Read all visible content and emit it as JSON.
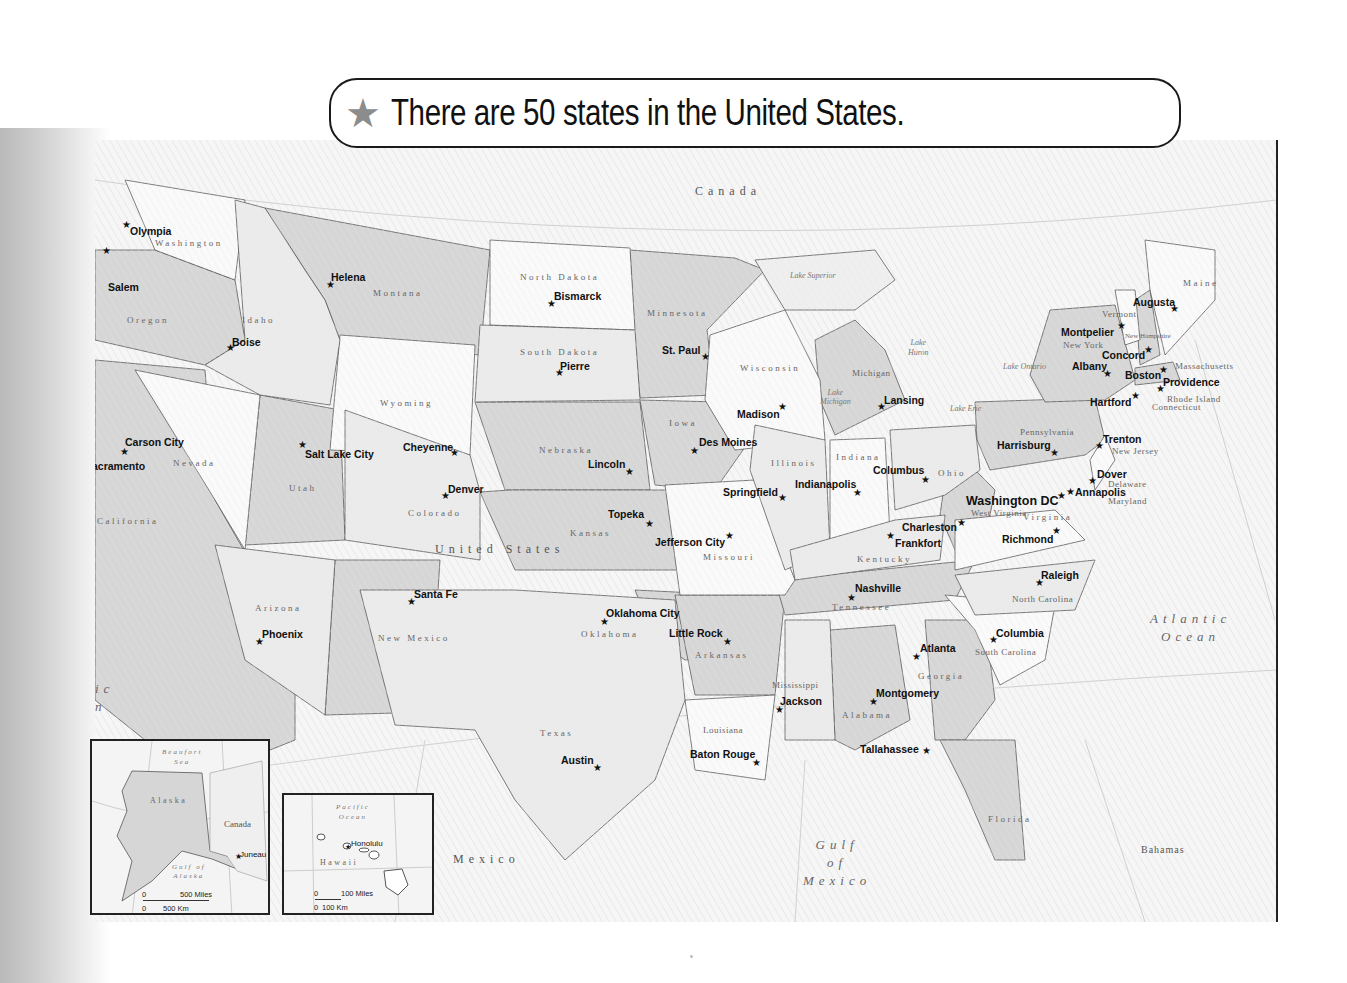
{
  "banner": {
    "icon": "★",
    "title": "There are 50 states in the United States."
  },
  "regions": {
    "canada": "Canada",
    "united_states": "United States",
    "mexico": "Mexico",
    "bahamas": "Bahamas",
    "atlantic_ocean": [
      "Atlantic",
      "Ocean"
    ],
    "gulf_of_mexico": [
      "Gulf",
      "of",
      "Mexico"
    ],
    "pacific_partial": [
      "ic",
      "n"
    ]
  },
  "lakes": {
    "superior": "Lake Superior",
    "michigan": [
      "Lake",
      "Michigan"
    ],
    "huron": [
      "Lake",
      "Huron"
    ],
    "erie": "Lake Erie",
    "ontario": "Lake Ontario"
  },
  "states": [
    {
      "name": "Washington",
      "x": 60,
      "y": 98
    },
    {
      "name": "Oregon",
      "x": 32,
      "y": 175
    },
    {
      "name": "Idaho",
      "x": 147,
      "y": 175
    },
    {
      "name": "Montana",
      "x": 278,
      "y": 148
    },
    {
      "name": "Wyoming",
      "x": 285,
      "y": 258
    },
    {
      "name": "North Dakota",
      "x": 425,
      "y": 132
    },
    {
      "name": "South Dakota",
      "x": 425,
      "y": 207
    },
    {
      "name": "Minnesota",
      "x": 552,
      "y": 168
    },
    {
      "name": "Wisconsin",
      "x": 645,
      "y": 223
    },
    {
      "name": "Michigan",
      "x": 757,
      "y": 228
    },
    {
      "name": "Nevada",
      "x": 78,
      "y": 318
    },
    {
      "name": "Utah",
      "x": 194,
      "y": 343
    },
    {
      "name": "Colorado",
      "x": 313,
      "y": 368
    },
    {
      "name": "Nebraska",
      "x": 444,
      "y": 305
    },
    {
      "name": "Iowa",
      "x": 574,
      "y": 278
    },
    {
      "name": "Illinois",
      "x": 676,
      "y": 318
    },
    {
      "name": "Indiana",
      "x": 741,
      "y": 312
    },
    {
      "name": "Ohio",
      "x": 843,
      "y": 328
    },
    {
      "name": "Pennsylvania",
      "x": 925,
      "y": 287
    },
    {
      "name": "New York",
      "x": 968,
      "y": 200
    },
    {
      "name": "Vermont",
      "x": 1007,
      "y": 169
    },
    {
      "name": "New Hampshire",
      "x": 1030,
      "y": 192
    },
    {
      "name": "Maine",
      "x": 1088,
      "y": 138
    },
    {
      "name": "Massachusetts",
      "x": 1080,
      "y": 221
    },
    {
      "name": "Rhode Island",
      "x": 1072,
      "y": 254
    },
    {
      "name": "Connecticut",
      "x": 1057,
      "y": 262
    },
    {
      "name": "New Jersey",
      "x": 1017,
      "y": 306
    },
    {
      "name": "Delaware",
      "x": 1013,
      "y": 339
    },
    {
      "name": "Maryland",
      "x": 1013,
      "y": 356
    },
    {
      "name": "West Virginia",
      "x": 876,
      "y": 368
    },
    {
      "name": "Virginia",
      "x": 928,
      "y": 372
    },
    {
      "name": "California",
      "x": 2,
      "y": 376
    },
    {
      "name": "Kansas",
      "x": 475,
      "y": 388
    },
    {
      "name": "Missouri",
      "x": 608,
      "y": 412
    },
    {
      "name": "Kentucky",
      "x": 762,
      "y": 414
    },
    {
      "name": "Tennessee",
      "x": 737,
      "y": 462
    },
    {
      "name": "North Carolina",
      "x": 917,
      "y": 454
    },
    {
      "name": "Arizona",
      "x": 160,
      "y": 463
    },
    {
      "name": "New Mexico",
      "x": 283,
      "y": 493
    },
    {
      "name": "Oklahoma",
      "x": 486,
      "y": 489
    },
    {
      "name": "Arkansas",
      "x": 600,
      "y": 510
    },
    {
      "name": "South Carolina",
      "x": 880,
      "y": 507
    },
    {
      "name": "Mississippi",
      "x": 677,
      "y": 540
    },
    {
      "name": "Georgia",
      "x": 823,
      "y": 531
    },
    {
      "name": "Alabama",
      "x": 747,
      "y": 570
    },
    {
      "name": "Texas",
      "x": 445,
      "y": 588
    },
    {
      "name": "Louisiana",
      "x": 608,
      "y": 585
    },
    {
      "name": "Florida",
      "x": 893,
      "y": 674
    }
  ],
  "capitals": [
    {
      "name": "Olympia",
      "lx": 35,
      "ly": 85,
      "sx": 27,
      "sy": 80
    },
    {
      "name": "Salem",
      "lx": 13,
      "ly": 141,
      "sx": 7,
      "sy": 106
    },
    {
      "name": "Helena",
      "lx": 236,
      "ly": 131,
      "sx": 231,
      "sy": 140
    },
    {
      "name": "Boise",
      "lx": 137,
      "ly": 196,
      "sx": 131,
      "sy": 203
    },
    {
      "name": "Bismarck",
      "lx": 459,
      "ly": 150,
      "sx": 452,
      "sy": 159
    },
    {
      "name": "Pierre",
      "lx": 465,
      "ly": 220,
      "sx": 460,
      "sy": 228
    },
    {
      "name": "St. Paul",
      "lx": 567,
      "ly": 204,
      "sx": 606,
      "sy": 212
    },
    {
      "name": "Madison",
      "lx": 642,
      "ly": 268,
      "sx": 683,
      "sy": 262
    },
    {
      "name": "Lansing",
      "lx": 789,
      "ly": 254,
      "sx": 782,
      "sy": 262
    },
    {
      "name": "Augusta",
      "lx": 1038,
      "ly": 156,
      "sx": 1075,
      "sy": 164
    },
    {
      "name": "Montpelier",
      "lx": 966,
      "ly": 186,
      "sx": 1022,
      "sy": 181
    },
    {
      "name": "Concord",
      "lx": 1007,
      "ly": 209,
      "sx": 1049,
      "sy": 205
    },
    {
      "name": "Albany",
      "lx": 977,
      "ly": 220,
      "sx": 1008,
      "sy": 229
    },
    {
      "name": "Boston",
      "lx": 1030,
      "ly": 229,
      "sx": 1064,
      "sy": 225
    },
    {
      "name": "Providence",
      "lx": 1068,
      "ly": 236,
      "sx": 1061,
      "sy": 244
    },
    {
      "name": "Hartford",
      "lx": 995,
      "ly": 256,
      "sx": 1036,
      "sy": 251
    },
    {
      "name": "Carson City",
      "lx": 30,
      "ly": 296,
      "sx": 25,
      "sy": 307
    },
    {
      "name": "Sacramento",
      "lx": -10,
      "ly": 320,
      "sx": -20,
      "sy": 325
    },
    {
      "name": "Salt Lake City",
      "lx": 210,
      "ly": 308,
      "sx": 203,
      "sy": 300
    },
    {
      "name": "Cheyenne",
      "lx": 308,
      "ly": 301,
      "sx": 355,
      "sy": 308
    },
    {
      "name": "Denver",
      "lx": 353,
      "ly": 343,
      "sx": 346,
      "sy": 351
    },
    {
      "name": "Lincoln",
      "lx": 493,
      "ly": 318,
      "sx": 530,
      "sy": 327
    },
    {
      "name": "Des Moines",
      "lx": 604,
      "ly": 296,
      "sx": 595,
      "sy": 306
    },
    {
      "name": "Springfield",
      "lx": 628,
      "ly": 346,
      "sx": 683,
      "sy": 353
    },
    {
      "name": "Indianapolis",
      "lx": 700,
      "ly": 338,
      "sx": 758,
      "sy": 348
    },
    {
      "name": "Columbus",
      "lx": 778,
      "ly": 324,
      "sx": 826,
      "sy": 335
    },
    {
      "name": "Harrisburg",
      "lx": 902,
      "ly": 299,
      "sx": 955,
      "sy": 308
    },
    {
      "name": "Trenton",
      "lx": 1008,
      "ly": 293,
      "sx": 1000,
      "sy": 301
    },
    {
      "name": "Dover",
      "lx": 1002,
      "ly": 328,
      "sx": 993,
      "sy": 336
    },
    {
      "name": "Annapolis",
      "lx": 980,
      "ly": 346,
      "sx": 971,
      "sy": 347
    },
    {
      "name": "Washington DC",
      "lx": 871,
      "ly": 354,
      "sx": 962,
      "sy": 351,
      "big": true
    },
    {
      "name": "Charleston",
      "lx": 807,
      "ly": 381,
      "sx": 862,
      "sy": 378
    },
    {
      "name": "Frankfort",
      "lx": 800,
      "ly": 397,
      "sx": 791,
      "sy": 391
    },
    {
      "name": "Richmond",
      "lx": 907,
      "ly": 393,
      "sx": 957,
      "sy": 386
    },
    {
      "name": "Topeka",
      "lx": 513,
      "ly": 368,
      "sx": 550,
      "sy": 379
    },
    {
      "name": "Jefferson City",
      "lx": 560,
      "ly": 396,
      "sx": 630,
      "sy": 391
    },
    {
      "name": "Nashville",
      "lx": 760,
      "ly": 442,
      "sx": 752,
      "sy": 453
    },
    {
      "name": "Raleigh",
      "lx": 946,
      "ly": 429,
      "sx": 940,
      "sy": 438
    },
    {
      "name": "Oklahoma City",
      "lx": 511,
      "ly": 467,
      "sx": 505,
      "sy": 477
    },
    {
      "name": "Little Rock",
      "lx": 574,
      "ly": 487,
      "sx": 628,
      "sy": 497
    },
    {
      "name": "Santa Fe",
      "lx": 319,
      "ly": 448,
      "sx": 312,
      "sy": 457
    },
    {
      "name": "Phoenix",
      "lx": 167,
      "ly": 488,
      "sx": 160,
      "sy": 497
    },
    {
      "name": "Columbia",
      "lx": 901,
      "ly": 487,
      "sx": 894,
      "sy": 495
    },
    {
      "name": "Atlanta",
      "lx": 825,
      "ly": 502,
      "sx": 817,
      "sy": 512
    },
    {
      "name": "Jackson",
      "lx": 685,
      "ly": 555,
      "sx": 680,
      "sy": 565
    },
    {
      "name": "Montgomery",
      "lx": 781,
      "ly": 547,
      "sx": 774,
      "sy": 557
    },
    {
      "name": "Austin",
      "lx": 466,
      "ly": 614,
      "sx": 498,
      "sy": 623
    },
    {
      "name": "Baton Rouge",
      "lx": 595,
      "ly": 608,
      "sx": 657,
      "sy": 618
    },
    {
      "name": "Tallahassee",
      "lx": 765,
      "ly": 603,
      "sx": 827,
      "sy": 606
    }
  ],
  "insets": {
    "alaska": {
      "state": "Alaska",
      "sea": [
        "Beaufort",
        "Sea"
      ],
      "gulf": [
        "Gulf of",
        "Alaska"
      ],
      "country": "Canada",
      "capital": "Juneau",
      "scale_miles_zero": "0",
      "scale_miles": "500 Miles",
      "scale_km_zero": "0",
      "scale_km": "500 Km"
    },
    "hawaii": {
      "state": "Hawaii",
      "ocean": [
        "Pacific",
        "Ocean"
      ],
      "capital": "Honolulu",
      "scale_miles_zero": "0",
      "scale_miles": "100 Miles",
      "scale_km_zero": "0",
      "scale_km": "100 Km"
    }
  },
  "colors": {
    "shaded_state": "#d6d6d6",
    "white_state": "#fafafa",
    "water": "#f4f4f4",
    "border": "#555555",
    "banner_star": "#8c8c8c"
  }
}
